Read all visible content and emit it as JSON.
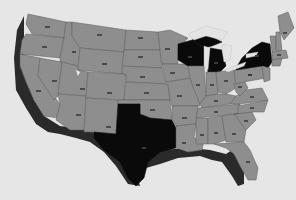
{
  "map": {
    "type": "choropleth",
    "region": "United States (contiguous)",
    "style": "grayscale",
    "colors": {
      "background": "#e6e6e6",
      "state_default": "#8e8e8e",
      "state_highlighted": "#0a0a0a",
      "border": "#5a5a5a",
      "shadow": "#2a2a2a",
      "water": "#e4e4e4"
    },
    "highlighted_states": [
      "Wisconsin",
      "Michigan",
      "New York",
      "Texas"
    ],
    "state_labels_legible": false,
    "states": [
      {
        "name": "Washington",
        "label": "",
        "highlighted": false
      },
      {
        "name": "Oregon",
        "label": "",
        "highlighted": false
      },
      {
        "name": "California",
        "label": "",
        "highlighted": false
      },
      {
        "name": "Idaho",
        "label": "",
        "highlighted": false
      },
      {
        "name": "Nevada",
        "label": "",
        "highlighted": false
      },
      {
        "name": "Montana",
        "label": "",
        "highlighted": false
      },
      {
        "name": "Wyoming",
        "label": "",
        "highlighted": false
      },
      {
        "name": "Utah",
        "label": "",
        "highlighted": false
      },
      {
        "name": "Arizona",
        "label": "",
        "highlighted": false
      },
      {
        "name": "Colorado",
        "label": "",
        "highlighted": false
      },
      {
        "name": "New Mexico",
        "label": "",
        "highlighted": false
      },
      {
        "name": "North Dakota",
        "label": "",
        "highlighted": false
      },
      {
        "name": "South Dakota",
        "label": "",
        "highlighted": false
      },
      {
        "name": "Nebraska",
        "label": "",
        "highlighted": false
      },
      {
        "name": "Kansas",
        "label": "",
        "highlighted": false
      },
      {
        "name": "Oklahoma",
        "label": "",
        "highlighted": false
      },
      {
        "name": "Texas",
        "label": "",
        "highlighted": true
      },
      {
        "name": "Minnesota",
        "label": "",
        "highlighted": false
      },
      {
        "name": "Iowa",
        "label": "",
        "highlighted": false
      },
      {
        "name": "Missouri",
        "label": "",
        "highlighted": false
      },
      {
        "name": "Arkansas",
        "label": "",
        "highlighted": false
      },
      {
        "name": "Louisiana",
        "label": "",
        "highlighted": false
      },
      {
        "name": "Wisconsin",
        "label": "",
        "highlighted": true
      },
      {
        "name": "Illinois",
        "label": "",
        "highlighted": false
      },
      {
        "name": "Michigan",
        "label": "",
        "highlighted": true
      },
      {
        "name": "Indiana",
        "label": "",
        "highlighted": false
      },
      {
        "name": "Ohio",
        "label": "",
        "highlighted": false
      },
      {
        "name": "Kentucky",
        "label": "",
        "highlighted": false
      },
      {
        "name": "Tennessee",
        "label": "",
        "highlighted": false
      },
      {
        "name": "Mississippi",
        "label": "",
        "highlighted": false
      },
      {
        "name": "Alabama",
        "label": "",
        "highlighted": false
      },
      {
        "name": "Georgia",
        "label": "",
        "highlighted": false
      },
      {
        "name": "Florida",
        "label": "",
        "highlighted": false
      },
      {
        "name": "South Carolina",
        "label": "",
        "highlighted": false
      },
      {
        "name": "North Carolina",
        "label": "",
        "highlighted": false
      },
      {
        "name": "Virginia",
        "label": "",
        "highlighted": false
      },
      {
        "name": "West Virginia",
        "label": "",
        "highlighted": false
      },
      {
        "name": "Pennsylvania",
        "label": "",
        "highlighted": false
      },
      {
        "name": "New York",
        "label": "",
        "highlighted": true
      },
      {
        "name": "Vermont",
        "label": "",
        "highlighted": false
      },
      {
        "name": "New Hampshire",
        "label": "",
        "highlighted": false
      },
      {
        "name": "Maine",
        "label": "",
        "highlighted": false
      },
      {
        "name": "Massachusetts",
        "label": "",
        "highlighted": false
      }
    ]
  }
}
